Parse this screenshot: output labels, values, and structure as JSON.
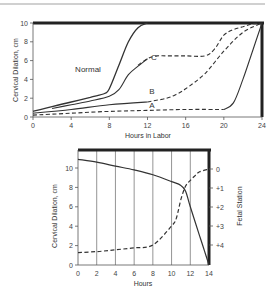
{
  "chart_data": [
    {
      "type": "line",
      "title": "",
      "xlabel": "Hours in Labor",
      "ylabel": "Cervical Dilation, cm",
      "xlim": [
        0,
        24
      ],
      "ylim": [
        0,
        10
      ],
      "xticks": [
        "0",
        "4",
        "8",
        "12",
        "16",
        "20",
        "24"
      ],
      "yticks": [
        "0",
        "2",
        "4",
        "6",
        "8",
        "10"
      ],
      "grid": false,
      "series": [
        {
          "name": "Normal",
          "style": "solid",
          "label": "Normal",
          "x": [
            0,
            2,
            4,
            6,
            7.5,
            8,
            9,
            10,
            11,
            12
          ],
          "y": [
            0.6,
            1.1,
            1.6,
            2.1,
            2.5,
            3.0,
            5.5,
            8.0,
            9.5,
            10
          ]
        },
        {
          "name": "Upper solid",
          "style": "solid",
          "label": "",
          "x": [
            2,
            4,
            6,
            8,
            9,
            10,
            11,
            12
          ],
          "y": [
            0.9,
            1.3,
            1.7,
            2.2,
            2.9,
            4.5,
            5.4,
            6.2
          ]
        },
        {
          "name": "C",
          "style": "dashed",
          "label": "C",
          "x": [
            11,
            12,
            13,
            14,
            16,
            18,
            19,
            20,
            21,
            22,
            23,
            24
          ],
          "y": [
            5.5,
            6.2,
            6.5,
            6.5,
            6.5,
            6.5,
            7.2,
            8.7,
            9.3,
            9.6,
            9.9,
            10
          ]
        },
        {
          "name": "B",
          "style": "solid-then-dashed",
          "label": "B",
          "x": [
            0,
            4,
            8,
            12,
            14,
            15,
            16,
            18,
            20,
            22,
            24
          ],
          "y": [
            0.4,
            0.8,
            1.3,
            1.6,
            2.0,
            2.4,
            3.0,
            4.6,
            7.0,
            9.0,
            10
          ]
        },
        {
          "name": "A",
          "style": "dashed-then-solid",
          "label": "A",
          "x": [
            0,
            4,
            8,
            12,
            16,
            20,
            21,
            22,
            23,
            24
          ],
          "y": [
            0.2,
            0.4,
            0.6,
            0.7,
            0.8,
            0.8,
            1.5,
            4.0,
            7.0,
            10
          ]
        }
      ]
    },
    {
      "type": "line",
      "title": "",
      "xlabel": "Hours",
      "ylabel": "Cervical Dilation, cm",
      "y2label": "Fetal Station",
      "xlim": [
        0,
        14
      ],
      "ylim": [
        0,
        10
      ],
      "y2lim": [
        0,
        4
      ],
      "xticks": [
        "0",
        "2",
        "4",
        "6",
        "8",
        "10",
        "12",
        "14"
      ],
      "yticks": [
        "0",
        "2",
        "4",
        "6",
        "8",
        "10"
      ],
      "y2ticks": [
        "0",
        "+1",
        "+2",
        "+3",
        "+4"
      ],
      "grid": "vertical",
      "series": [
        {
          "name": "Cervical dilation",
          "style": "solid",
          "axis": "left",
          "x": [
            0,
            2,
            4,
            6,
            8,
            10,
            11,
            11.5,
            12,
            13,
            13.5,
            14
          ],
          "y": [
            10.9,
            10.6,
            10.2,
            9.8,
            9.3,
            8.6,
            8.2,
            7.6,
            6.0,
            3.0,
            1.5,
            0
          ]
        },
        {
          "name": "Fetal station",
          "style": "dashed",
          "axis": "right",
          "x": [
            0,
            2,
            4,
            6,
            8,
            10,
            10.5,
            11,
            11.5,
            12,
            12.5,
            13,
            14
          ],
          "y": [
            4.4,
            4.35,
            4.25,
            4.15,
            4.0,
            3.0,
            2.6,
            1.6,
            0.9,
            0.6,
            0.35,
            0.15,
            0
          ]
        }
      ]
    }
  ]
}
